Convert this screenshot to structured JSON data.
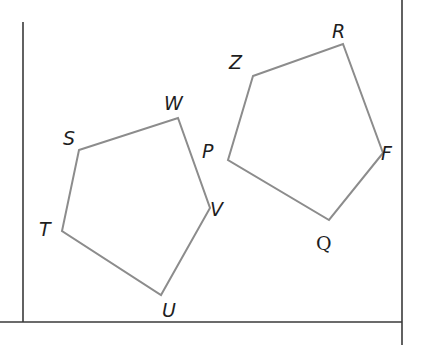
{
  "diagram": {
    "title": "",
    "frame": {
      "left_line": {
        "x": 23,
        "y1": 22,
        "y2": 322
      },
      "bottom_line": {
        "y": 322,
        "x1": 0,
        "x2": 402
      },
      "right_line": {
        "x": 402,
        "y1": 0,
        "y2": 345
      },
      "color": "#3a3a3a"
    },
    "stroke_color": "#8c8c8c",
    "pentagons": [
      {
        "name": "STUVW",
        "vertices": [
          {
            "label": "S",
            "x": 79,
            "y": 150,
            "lx": 64,
            "ly": 145
          },
          {
            "label": "W",
            "x": 178,
            "y": 118,
            "lx": 166,
            "ly": 110
          },
          {
            "label": "V",
            "x": 210,
            "y": 208,
            "lx": 211,
            "ly": 216
          },
          {
            "label": "U",
            "x": 161,
            "y": 295,
            "lx": 163,
            "ly": 317
          },
          {
            "label": "T",
            "x": 62,
            "y": 231,
            "lx": 40,
            "ly": 236
          }
        ]
      },
      {
        "name": "PZRFQ",
        "vertices": [
          {
            "label": "Z",
            "x": 253,
            "y": 76,
            "lx": 230,
            "ly": 69
          },
          {
            "label": "R",
            "x": 343,
            "y": 44,
            "lx": 333,
            "ly": 38
          },
          {
            "label": "F",
            "x": 383,
            "y": 153,
            "lx": 382,
            "ly": 160
          },
          {
            "label": "Q",
            "x": 329,
            "y": 220,
            "lx": 317,
            "ly": 250
          },
          {
            "label": "P",
            "x": 228,
            "y": 160,
            "lx": 203,
            "ly": 158
          }
        ]
      }
    ],
    "labels": {
      "S": "S",
      "W": "W",
      "V": "V",
      "U": "U",
      "T": "T",
      "Z": "Z",
      "R": "R",
      "F": "F",
      "Q": "Q",
      "P": "P"
    }
  }
}
